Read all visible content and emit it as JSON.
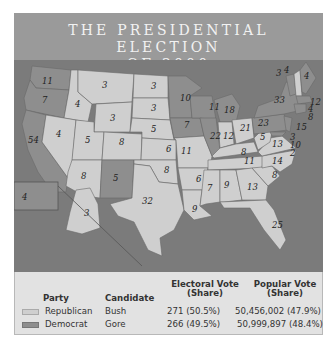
{
  "title": {
    "line1": "THE PRESIDENTIAL ELECTION",
    "line2": "OF 2000"
  },
  "colors": {
    "republican": "#cfcfcf",
    "democrat": "#8e8e8e",
    "water": "#7b7b7b",
    "header": "#9a9a9a"
  },
  "map": {
    "states": [
      {
        "abbr": "WA",
        "ev": "11",
        "party": "democrat"
      },
      {
        "abbr": "OR",
        "ev": "7",
        "party": "democrat"
      },
      {
        "abbr": "CA",
        "ev": "54",
        "party": "democrat"
      },
      {
        "abbr": "ID",
        "ev": "4",
        "party": "republican"
      },
      {
        "abbr": "NV",
        "ev": "4",
        "party": "republican"
      },
      {
        "abbr": "MT",
        "ev": "3",
        "party": "republican"
      },
      {
        "abbr": "WY",
        "ev": "3",
        "party": "republican"
      },
      {
        "abbr": "UT",
        "ev": "5",
        "party": "republican"
      },
      {
        "abbr": "AZ",
        "ev": "8",
        "party": "republican"
      },
      {
        "abbr": "CO",
        "ev": "8",
        "party": "republican"
      },
      {
        "abbr": "NM",
        "ev": "5",
        "party": "democrat"
      },
      {
        "abbr": "ND",
        "ev": "3",
        "party": "republican"
      },
      {
        "abbr": "SD",
        "ev": "3",
        "party": "republican"
      },
      {
        "abbr": "NE",
        "ev": "5",
        "party": "republican"
      },
      {
        "abbr": "KS",
        "ev": "6",
        "party": "republican"
      },
      {
        "abbr": "OK",
        "ev": "8",
        "party": "republican"
      },
      {
        "abbr": "TX",
        "ev": "32",
        "party": "republican"
      },
      {
        "abbr": "MN",
        "ev": "10",
        "party": "democrat"
      },
      {
        "abbr": "IA",
        "ev": "7",
        "party": "democrat"
      },
      {
        "abbr": "MO",
        "ev": "11",
        "party": "republican"
      },
      {
        "abbr": "AR",
        "ev": "6",
        "party": "republican"
      },
      {
        "abbr": "LA",
        "ev": "9",
        "party": "republican"
      },
      {
        "abbr": "WI",
        "ev": "11",
        "party": "democrat"
      },
      {
        "abbr": "IL",
        "ev": "22",
        "party": "democrat"
      },
      {
        "abbr": "MI",
        "ev": "18",
        "party": "democrat"
      },
      {
        "abbr": "IN",
        "ev": "12",
        "party": "republican"
      },
      {
        "abbr": "OH",
        "ev": "21",
        "party": "republican"
      },
      {
        "abbr": "KY",
        "ev": "8",
        "party": "republican"
      },
      {
        "abbr": "TN",
        "ev": "11",
        "party": "republican"
      },
      {
        "abbr": "MS",
        "ev": "7",
        "party": "republican"
      },
      {
        "abbr": "AL",
        "ev": "9",
        "party": "republican"
      },
      {
        "abbr": "GA",
        "ev": "13",
        "party": "republican"
      },
      {
        "abbr": "FL",
        "ev": "25",
        "party": "republican"
      },
      {
        "abbr": "SC",
        "ev": "8",
        "party": "republican"
      },
      {
        "abbr": "NC",
        "ev": "14",
        "party": "republican"
      },
      {
        "abbr": "VA",
        "ev": "13",
        "party": "republican"
      },
      {
        "abbr": "WV",
        "ev": "5",
        "party": "republican"
      },
      {
        "abbr": "PA",
        "ev": "23",
        "party": "democrat"
      },
      {
        "abbr": "NY",
        "ev": "33",
        "party": "democrat"
      },
      {
        "abbr": "VT",
        "ev": "3",
        "party": "democrat"
      },
      {
        "abbr": "NH",
        "ev": "4",
        "party": "republican"
      },
      {
        "abbr": "ME",
        "ev": "4",
        "party": "democrat"
      },
      {
        "abbr": "MA",
        "ev": "12",
        "party": "democrat"
      },
      {
        "abbr": "RI",
        "ev": "4",
        "party": "democrat"
      },
      {
        "abbr": "CT",
        "ev": "8",
        "party": "democrat"
      },
      {
        "abbr": "NJ",
        "ev": "15",
        "party": "democrat"
      },
      {
        "abbr": "DE",
        "ev": "3",
        "party": "democrat"
      },
      {
        "abbr": "MD",
        "ev": "10",
        "party": "democrat"
      },
      {
        "abbr": "DC",
        "ev": "2",
        "party": "democrat"
      },
      {
        "abbr": "AK",
        "ev": "3",
        "party": "republican"
      },
      {
        "abbr": "HI",
        "ev": "4",
        "party": "democrat"
      }
    ]
  },
  "legend": {
    "headers": {
      "party": "Party",
      "candidate": "Candidate",
      "electoral_l1": "Electoral Vote",
      "electoral_l2": "(Share)",
      "popular_l1": "Popular Vote",
      "popular_l2": "(Share)"
    },
    "rows": [
      {
        "party": "Republican",
        "candidate": "Bush",
        "electoral": "271 (50.5%)",
        "popular": "50,456,002 (47.9%)"
      },
      {
        "party": "Democrat",
        "candidate": "Gore",
        "electoral": "266 (49.5%)",
        "popular": "50,999,897 (48.4%)"
      }
    ]
  }
}
